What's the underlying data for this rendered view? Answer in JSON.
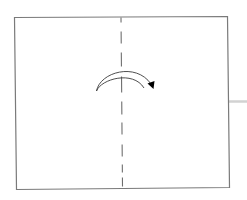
{
  "diagram": {
    "type": "origami-fold-step",
    "paper": {
      "corners": {
        "top_left": [
          14,
          17
        ],
        "top_right": [
          227,
          16
        ],
        "bottom_right": [
          229,
          187
        ],
        "bottom_left": [
          16,
          189
        ]
      },
      "stroke_color": "#7a7a7a",
      "fill_color": "#ffffff"
    },
    "fold_line": {
      "style": "dashed",
      "x_top": 121,
      "y_top": 17,
      "x_bottom": 122,
      "y_bottom": 188,
      "dash": 12,
      "gap": 8,
      "color": "#6e6e6e"
    },
    "fold_arrow": {
      "direction": "left-to-right",
      "color": "#3a3a3a",
      "arrowhead_color": "#000000"
    },
    "side_connector": {
      "color": "#cfcfcf",
      "y": 101,
      "x_start": 229,
      "x_end": 247
    }
  }
}
